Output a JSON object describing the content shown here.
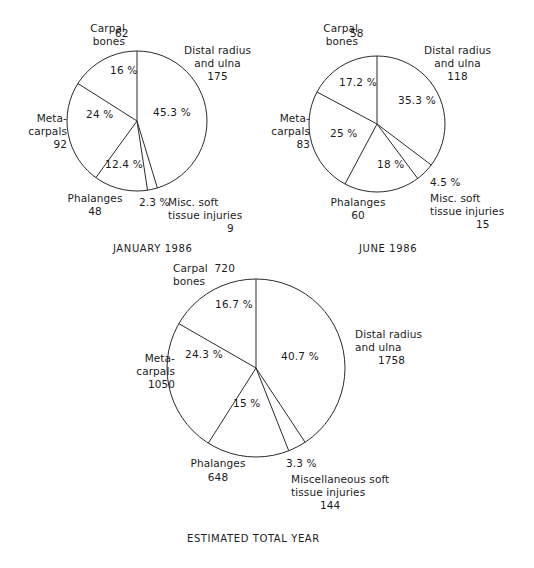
{
  "figure": {
    "background": "#ffffff",
    "stroke_color": "#2a2a2a",
    "text_color": "#1b1b1b"
  },
  "chart_data": [
    {
      "type": "pie",
      "title": "JANUARY 1986",
      "caption": "JANUARY 1986",
      "categories": [
        "Distal radius and ulna",
        "Misc. soft tissue injuries",
        "Phalanges",
        "Metacarpals",
        "Carpal bones"
      ],
      "values": [
        175,
        9,
        48,
        92,
        62
      ],
      "percents": [
        45.3,
        2.3,
        12.4,
        24,
        16
      ],
      "percent_labels": [
        "45.3 %",
        "2.3 %",
        "12.4 %",
        "24 %",
        "16 %"
      ],
      "value_labels": [
        "175",
        "9",
        "48",
        "92",
        "62"
      ],
      "total": 386,
      "start_angle_deg": 0,
      "direction": "clockwise",
      "labels": {
        "carpal_bones_name": "Carpal\nbones",
        "carpal_bones_value": "62",
        "distal_name": "Distal radius\nand ulna",
        "distal_value": "175",
        "meta_name": "Meta-\ncarpals",
        "meta_value": "92",
        "phalanges_name": "Phalanges",
        "phalanges_value": "48",
        "misc_pct": "2.3 %",
        "misc_name_1": "Misc. soft",
        "misc_name_2": "tissue injuries",
        "misc_value": "9",
        "pct_distal": "45.3 %",
        "pct_carpal": "16 %",
        "pct_meta": "24 %",
        "pct_phalanges": "12.4 %"
      }
    },
    {
      "type": "pie",
      "title": "JUNE 1986",
      "caption": "JUNE 1986",
      "categories": [
        "Distal radius and ulna",
        "Misc. soft tissue injuries",
        "Phalanges",
        "Metacarpals",
        "Carpal bones"
      ],
      "values": [
        118,
        15,
        60,
        83,
        58
      ],
      "percents": [
        35.3,
        4.5,
        18,
        25,
        17.2
      ],
      "percent_labels": [
        "35.3 %",
        "4.5 %",
        "18 %",
        "25 %",
        "17.2 %"
      ],
      "value_labels": [
        "118",
        "15",
        "60",
        "83",
        "58"
      ],
      "total": 334,
      "start_angle_deg": 0,
      "direction": "clockwise",
      "labels": {
        "carpal_bones_name": "Carpal\nbones",
        "carpal_bones_value": "58",
        "distal_name": "Distal radius\nand ulna",
        "distal_value": "118",
        "meta_name": "Meta-\ncarpals",
        "meta_value": "83",
        "phalanges_name": "Phalanges",
        "phalanges_value": "60",
        "misc_pct": "4.5 %",
        "misc_name_1": "Misc. soft",
        "misc_name_2": "tissue injuries",
        "misc_value": "15",
        "pct_distal": "35.3 %",
        "pct_carpal": "17.2 %",
        "pct_meta": "25 %",
        "pct_phalanges": "18 %"
      }
    },
    {
      "type": "pie",
      "title": "ESTIMATED TOTAL YEAR",
      "caption": "ESTIMATED TOTAL YEAR",
      "categories": [
        "Distal radius and ulna",
        "Miscellaneous soft tissue injuries",
        "Phalanges",
        "Metacarpals",
        "Carpal bones"
      ],
      "values": [
        1758,
        144,
        648,
        1050,
        720
      ],
      "percents": [
        40.7,
        3.3,
        15,
        24.3,
        16.7
      ],
      "percent_labels": [
        "40.7 %",
        "3.3 %",
        "15 %",
        "24.3 %",
        "16.7 %"
      ],
      "value_labels": [
        "1758",
        "144",
        "648",
        "1050",
        "720"
      ],
      "total": 4320,
      "start_angle_deg": 0,
      "direction": "clockwise",
      "labels": {
        "carpal_bones_name": "Carpal  720",
        "carpal_bones_value": "bones",
        "distal_name": "Distal radius\nand ulna",
        "distal_value": "1758",
        "meta_name": "Meta-\ncarpals",
        "meta_value": "1050",
        "phalanges_name": "Phalanges",
        "phalanges_value": "648",
        "misc_pct": "3.3 %",
        "misc_name_1": "Miscellaneous soft",
        "misc_name_2": "tissue injuries",
        "misc_value": "144",
        "pct_distal": "40.7 %",
        "pct_carpal": "16.7 %",
        "pct_meta": "24.3 %",
        "pct_phalanges": "15 %"
      }
    }
  ]
}
